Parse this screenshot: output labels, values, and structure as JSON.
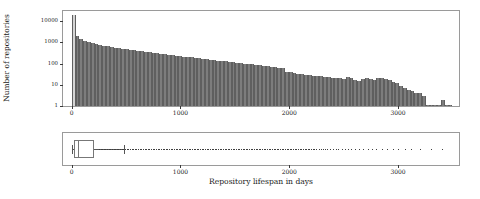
{
  "figure": {
    "xlabel": "Repository lifespan in days",
    "ylabel": "Number of repositories"
  },
  "chart_data": [
    {
      "type": "bar",
      "title": "",
      "xlabel": "",
      "ylabel": "Number of repositories",
      "yscale": "log",
      "ylim": [
        1,
        30000
      ],
      "xlim": [
        -80,
        3560
      ],
      "grid": false,
      "legend": null,
      "ytick_labels": [
        "1",
        "10",
        "100",
        "1000",
        "10000"
      ],
      "ytick_values": [
        1,
        10,
        100,
        1000,
        10000
      ],
      "xtick_labels": [
        "0",
        "1000",
        "2000",
        "3000"
      ],
      "xtick_values": [
        0,
        1000,
        2000,
        3000
      ],
      "bin_width": 35,
      "colors": {
        "first_bar": "#d4d4d4",
        "bars": "#7d7d7d",
        "edge": "#5f5f5f"
      },
      "x": [
        0,
        35,
        70,
        105,
        140,
        175,
        210,
        245,
        280,
        315,
        350,
        385,
        420,
        455,
        490,
        525,
        560,
        595,
        630,
        665,
        700,
        735,
        770,
        805,
        840,
        875,
        910,
        945,
        980,
        1015,
        1050,
        1085,
        1120,
        1155,
        1190,
        1225,
        1260,
        1295,
        1330,
        1365,
        1400,
        1435,
        1470,
        1505,
        1540,
        1575,
        1610,
        1645,
        1680,
        1715,
        1750,
        1785,
        1820,
        1855,
        1890,
        1925,
        1960,
        1995,
        2030,
        2065,
        2100,
        2135,
        2170,
        2205,
        2240,
        2275,
        2310,
        2345,
        2380,
        2415,
        2450,
        2485,
        2520,
        2555,
        2590,
        2625,
        2660,
        2695,
        2730,
        2765,
        2800,
        2835,
        2870,
        2905,
        2940,
        2975,
        3010,
        3045,
        3080,
        3115,
        3150,
        3185,
        3220,
        3255,
        3290,
        3325,
        3360,
        3395,
        3430,
        3465
      ],
      "values": [
        20000,
        2100,
        1400,
        1150,
        1000,
        900,
        820,
        760,
        700,
        650,
        610,
        570,
        540,
        500,
        470,
        440,
        420,
        400,
        380,
        360,
        340,
        320,
        300,
        290,
        275,
        260,
        250,
        235,
        225,
        215,
        205,
        195,
        185,
        175,
        168,
        160,
        152,
        145,
        138,
        132,
        126,
        120,
        115,
        110,
        105,
        100,
        96,
        92,
        88,
        84,
        80,
        76,
        72,
        68,
        64,
        60,
        42,
        38,
        36,
        34,
        32,
        30,
        28,
        27,
        26,
        25,
        24,
        23,
        22,
        21,
        20,
        19,
        24,
        22,
        16,
        15,
        19,
        20,
        18,
        17,
        22,
        20,
        18,
        16,
        14,
        12,
        9,
        7,
        6,
        5,
        4,
        4,
        3,
        1,
        1,
        1,
        1,
        2,
        1,
        1
      ]
    },
    {
      "type": "boxplot",
      "orientation": "horizontal",
      "xlabel": "Repository lifespan in days",
      "xlim": [
        -80,
        3560
      ],
      "xtick_labels": [
        "0",
        "1000",
        "2000",
        "3000"
      ],
      "xtick_values": [
        0,
        1000,
        2000,
        3000
      ],
      "q1": 20,
      "median": 55,
      "q3": 205,
      "whisker_low": 0,
      "whisker_high": 480,
      "outlier_density_note": "dense outlier strip from ~250 to ~2600, sparse beyond",
      "outliers": [
        250,
        265,
        280,
        295,
        310,
        325,
        340,
        355,
        370,
        385,
        400,
        415,
        430,
        445,
        460,
        475,
        490,
        505,
        520,
        535,
        550,
        565,
        580,
        595,
        610,
        625,
        640,
        655,
        670,
        685,
        700,
        715,
        730,
        745,
        760,
        775,
        790,
        805,
        820,
        835,
        850,
        865,
        880,
        895,
        910,
        925,
        940,
        955,
        970,
        985,
        1000,
        1015,
        1030,
        1045,
        1060,
        1075,
        1090,
        1105,
        1120,
        1135,
        1150,
        1165,
        1180,
        1195,
        1210,
        1225,
        1240,
        1255,
        1270,
        1285,
        1300,
        1315,
        1330,
        1345,
        1360,
        1375,
        1390,
        1405,
        1420,
        1435,
        1450,
        1465,
        1480,
        1495,
        1510,
        1525,
        1540,
        1555,
        1570,
        1585,
        1600,
        1615,
        1630,
        1645,
        1660,
        1675,
        1690,
        1705,
        1720,
        1735,
        1750,
        1765,
        1780,
        1795,
        1810,
        1825,
        1840,
        1855,
        1870,
        1885,
        1900,
        1915,
        1930,
        1945,
        1960,
        1975,
        1990,
        2005,
        2020,
        2035,
        2050,
        2065,
        2080,
        2095,
        2110,
        2125,
        2140,
        2155,
        2170,
        2185,
        2200,
        2215,
        2230,
        2250,
        2270,
        2290,
        2310,
        2330,
        2350,
        2375,
        2400,
        2425,
        2450,
        2480,
        2510,
        2540,
        2570,
        2600,
        2640,
        2680,
        2720,
        2760,
        2800,
        2850,
        2900,
        2950,
        3000,
        3060,
        3120,
        3200,
        3300,
        3400
      ]
    }
  ]
}
